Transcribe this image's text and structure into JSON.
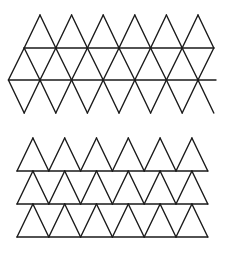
{
  "figures": [
    {
      "name": "triangular-lattice-net",
      "description": "Net of equilateral triangles: 6 diamonds across with two horizontal lines through the middle",
      "columns": 6,
      "top_apex_y": 15,
      "line1_y": 48,
      "line2_y": 80,
      "bottom_y": 113,
      "top_apex_x": [
        40,
        71.6,
        103.2,
        134.8,
        166.4,
        198
      ],
      "line1_x": [
        24.2,
        55.8,
        87.4,
        119,
        150.6,
        182.2,
        213.8
      ],
      "line2_x_start": 9,
      "line2_x_end": 216
    },
    {
      "name": "stacked-triangle-rows",
      "description": "Three stacked rows of 6 upright triangles, each row on a horizontal base line",
      "rows": 3,
      "columns": 6,
      "row_tops_y": [
        138,
        171,
        204
      ],
      "row_bases_y": [
        171,
        204,
        237
      ],
      "base_x_start": 17,
      "spacing": 31.8
    }
  ],
  "colors": {
    "stroke": "#1a1a1a",
    "background": "#ffffff"
  }
}
